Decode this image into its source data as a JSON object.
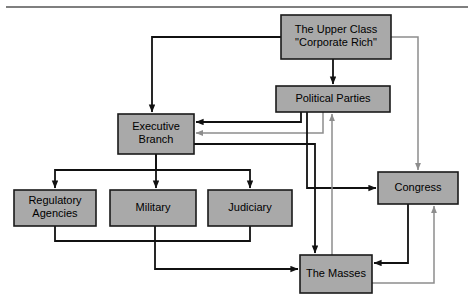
{
  "diagram": {
    "type": "flow-diagram",
    "canvas": {
      "width": 474,
      "height": 305
    },
    "colors": {
      "node_fill": "#a9a9a9",
      "node_stroke": "#1a1a1a",
      "edge_black": "#111111",
      "edge_gray": "#8d8d8d",
      "background": "#ffffff",
      "rule": "#555555"
    },
    "top_rule": {
      "x1": 6,
      "y1": 7,
      "x2": 468,
      "y2": 7
    },
    "nodes": [
      {
        "id": "upper-class",
        "label": "The Upper Class\n\"Corporate Rich\"",
        "lines": [
          "The Upper Class",
          "\"Corporate Rich\""
        ],
        "x": 281,
        "y": 15,
        "w": 110,
        "h": 44
      },
      {
        "id": "political-parties",
        "label": "Political Parties",
        "lines": [
          "Political Parties"
        ],
        "x": 276,
        "y": 86,
        "w": 114,
        "h": 26
      },
      {
        "id": "executive-branch",
        "label": "Executive Branch",
        "lines": [
          "Executive",
          "Branch"
        ],
        "x": 118,
        "y": 114,
        "w": 76,
        "h": 40
      },
      {
        "id": "regulatory-agencies",
        "label": "Regulatory Agencies",
        "lines": [
          "Regulatory",
          "Agencies"
        ],
        "x": 14,
        "y": 190,
        "w": 82,
        "h": 36
      },
      {
        "id": "military",
        "label": "Military",
        "lines": [
          "Military"
        ],
        "x": 110,
        "y": 190,
        "w": 86,
        "h": 36
      },
      {
        "id": "judiciary",
        "label": "Judiciary",
        "lines": [
          "Judiciary"
        ],
        "x": 208,
        "y": 190,
        "w": 84,
        "h": 36
      },
      {
        "id": "congress",
        "label": "Congress",
        "lines": [
          "Congress"
        ],
        "x": 378,
        "y": 172,
        "w": 80,
        "h": 32
      },
      {
        "id": "the-masses",
        "label": "The Masses",
        "lines": [
          "The Masses"
        ],
        "x": 300,
        "y": 255,
        "w": 72,
        "h": 38
      }
    ],
    "edges": [
      {
        "id": "upper-class-to-executive",
        "from": "upper-class",
        "to": "executive-branch",
        "color": "black",
        "width": 1.8,
        "arrow": "end",
        "points": "281,37 152,37 152,112"
      },
      {
        "id": "upper-class-to-political-parties",
        "from": "upper-class",
        "to": "political-parties",
        "color": "black",
        "width": 1.8,
        "arrow": "end",
        "points": "333,59 333,84"
      },
      {
        "id": "upper-class-to-congress",
        "from": "upper-class",
        "to": "congress",
        "color": "gray",
        "width": 1.5,
        "arrow": "end",
        "points": "391,37 418,37 418,170"
      },
      {
        "id": "political-parties-to-executive",
        "from": "political-parties",
        "to": "executive-branch",
        "color": "black",
        "width": 1.8,
        "arrow": "end",
        "points": "301,112 301,122 196,122"
      },
      {
        "id": "political-parties-to-executive-gray",
        "from": "political-parties",
        "to": "executive-branch",
        "color": "gray",
        "width": 1.5,
        "arrow": "end",
        "points": "323,112 323,133 196,133"
      },
      {
        "id": "political-parties-to-congress",
        "from": "political-parties",
        "to": "congress",
        "color": "black",
        "width": 1.8,
        "arrow": "end",
        "points": "307,112 307,188 376,188"
      },
      {
        "id": "masses-to-political-parties",
        "from": "the-masses",
        "to": "political-parties",
        "color": "gray",
        "width": 1.5,
        "arrow": "end",
        "points": "332,255 332,114"
      },
      {
        "id": "executive-to-masses",
        "from": "executive-branch",
        "to": "the-masses",
        "color": "black",
        "width": 1.8,
        "arrow": "end",
        "points": "194,144 315,144 315,253"
      },
      {
        "id": "executive-to-regulatory",
        "from": "executive-branch",
        "to": "regulatory-agencies",
        "color": "black",
        "width": 1.8,
        "arrow": "end",
        "points": "156,154 156,170 55,170 55,188"
      },
      {
        "id": "executive-to-military",
        "from": "executive-branch",
        "to": "military",
        "color": "black",
        "width": 1.8,
        "arrow": "end",
        "points": "156,154 156,188"
      },
      {
        "id": "executive-to-judiciary",
        "from": "executive-branch",
        "to": "judiciary",
        "color": "black",
        "width": 1.8,
        "arrow": "end",
        "points": "156,170 250,170 250,188"
      },
      {
        "id": "regulatory-to-masses",
        "from": "regulatory-agencies",
        "to": "the-masses",
        "color": "black",
        "width": 1.8,
        "arrow": "none",
        "points": "55,226 55,241 155,241"
      },
      {
        "id": "judiciary-to-masses",
        "from": "judiciary",
        "to": "the-masses",
        "color": "black",
        "width": 1.8,
        "arrow": "none",
        "points": "250,226 250,241 155,241"
      },
      {
        "id": "military-to-masses",
        "from": "military",
        "to": "the-masses",
        "color": "black",
        "width": 1.8,
        "arrow": "end",
        "points": "155,226 155,269 298,269"
      },
      {
        "id": "congress-to-masses",
        "from": "congress",
        "to": "the-masses",
        "color": "black",
        "width": 1.8,
        "arrow": "end",
        "points": "408,204 408,263 374,263"
      },
      {
        "id": "masses-to-congress",
        "from": "the-masses",
        "to": "congress",
        "color": "gray",
        "width": 1.5,
        "arrow": "end",
        "points": "372,283 434,283 434,206"
      }
    ]
  }
}
